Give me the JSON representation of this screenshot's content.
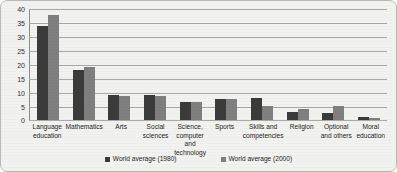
{
  "chart_data": {
    "type": "bar",
    "title": "",
    "subtitle": "",
    "xlabel": "",
    "ylabel": "",
    "ylim": [
      0,
      40
    ],
    "ytick_step": 5,
    "yticks": [
      "40",
      "35",
      "30",
      "25",
      "20",
      "15",
      "10",
      "5",
      "0"
    ],
    "grid": true,
    "legend_position": "bottom-center",
    "categories": [
      "Language education",
      "Mathematics",
      "Arts",
      "Social sciences",
      "Science, computer and technology",
      "Sports",
      "Skills and competencies",
      "Religion",
      "Optional and others",
      "Moral education"
    ],
    "series": [
      {
        "name": "World average (1980)",
        "color": "#3b3b3b",
        "values": [
          33.5,
          18.0,
          9.0,
          9.0,
          6.5,
          7.5,
          8.0,
          3.0,
          2.5,
          1.0
        ]
      },
      {
        "name": "World average (2000)",
        "color": "#7f7f7f",
        "values": [
          37.5,
          19.0,
          8.5,
          8.5,
          6.5,
          7.5,
          5.0,
          4.0,
          5.0,
          0.8
        ]
      }
    ]
  },
  "colors": {
    "series_1980": "#3b3b3b",
    "series_2000": "#7f7f7f",
    "gridline": "#a9a9a4",
    "background": "#f2f2f0",
    "border": "#b9b9b4"
  }
}
